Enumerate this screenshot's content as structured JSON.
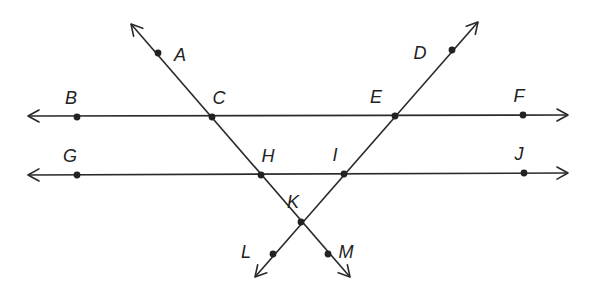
{
  "diagram": {
    "colors": {
      "stroke": "#2a2a2a",
      "point": "#222222",
      "background": "#ffffff"
    },
    "lines": [
      {
        "id": "line-BF",
        "name": "horizontal-line-top",
        "x1": 28,
        "y1": 116,
        "x2": 568,
        "y2": 115,
        "arrows": "both"
      },
      {
        "id": "line-GJ",
        "name": "horizontal-line-bottom",
        "x1": 28,
        "y1": 175,
        "x2": 568,
        "y2": 173,
        "arrows": "both"
      },
      {
        "id": "line-AM",
        "name": "transversal-AM",
        "x1": 131,
        "y1": 24,
        "x2": 350,
        "y2": 277,
        "arrows": "both"
      },
      {
        "id": "line-DL",
        "name": "transversal-DL",
        "x1": 478,
        "y1": 22,
        "x2": 255,
        "y2": 277,
        "arrows": "both"
      }
    ],
    "points": [
      {
        "label": "A",
        "x": 158,
        "y": 53,
        "lx": 180,
        "ly": 56
      },
      {
        "label": "B",
        "x": 77,
        "y": 117,
        "lx": 71,
        "ly": 99
      },
      {
        "label": "C",
        "x": 212,
        "y": 117,
        "lx": 219,
        "ly": 99
      },
      {
        "label": "D",
        "x": 452,
        "y": 50,
        "lx": 420,
        "ly": 54
      },
      {
        "label": "E",
        "x": 395,
        "y": 116,
        "lx": 376,
        "ly": 98
      },
      {
        "label": "F",
        "x": 523,
        "y": 115,
        "lx": 519,
        "ly": 97
      },
      {
        "label": "G",
        "x": 77,
        "y": 175,
        "lx": 70,
        "ly": 157
      },
      {
        "label": "H",
        "x": 261,
        "y": 175,
        "lx": 268,
        "ly": 157
      },
      {
        "label": "I",
        "x": 344,
        "y": 174,
        "lx": 335,
        "ly": 156
      },
      {
        "label": "J",
        "x": 524,
        "y": 173,
        "lx": 519,
        "ly": 155
      },
      {
        "label": "K",
        "x": 301,
        "y": 222,
        "lx": 293,
        "ly": 203
      },
      {
        "label": "L",
        "x": 273,
        "y": 254,
        "lx": 246,
        "ly": 253
      },
      {
        "label": "M",
        "x": 328,
        "y": 254,
        "lx": 346,
        "ly": 253
      }
    ]
  }
}
